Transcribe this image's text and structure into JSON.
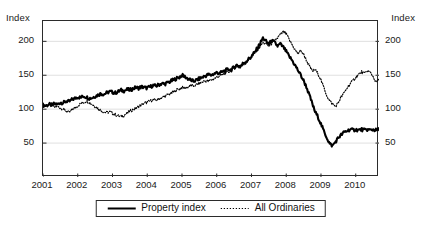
{
  "axes": {
    "left_unit_label": "Index",
    "right_unit_label": "Index",
    "y_ticks": [
      "200",
      "150",
      "100",
      "50"
    ],
    "x_ticks": [
      "2001",
      "2002",
      "2003",
      "2004",
      "2005",
      "2006",
      "2007",
      "2008",
      "2009",
      "2010"
    ]
  },
  "legend": {
    "items": [
      {
        "label": "Property index",
        "style": "solid",
        "color": "#000000"
      },
      {
        "label": "All Ordinaries",
        "style": "dotted",
        "color": "#000000"
      }
    ]
  },
  "chart_data": {
    "type": "line",
    "title": "",
    "subtitle": "",
    "xlabel": "",
    "ylabel": "Index",
    "y_unit_label": "Index",
    "xlim": [
      2001.0,
      2010.67
    ],
    "ylim": [
      0,
      230
    ],
    "y_ticks": [
      50,
      100,
      150,
      200
    ],
    "x_ticks": [
      2001,
      2002,
      2003,
      2004,
      2005,
      2006,
      2007,
      2008,
      2009,
      2010
    ],
    "grid": "horizontal",
    "legend_position": "bottom-center",
    "x": [
      2001.0,
      2001.08,
      2001.17,
      2001.25,
      2001.33,
      2001.42,
      2001.5,
      2001.58,
      2001.67,
      2001.75,
      2001.83,
      2001.92,
      2002.0,
      2002.08,
      2002.17,
      2002.25,
      2002.33,
      2002.42,
      2002.5,
      2002.58,
      2002.67,
      2002.75,
      2002.83,
      2002.92,
      2003.0,
      2003.08,
      2003.17,
      2003.25,
      2003.33,
      2003.42,
      2003.5,
      2003.58,
      2003.67,
      2003.75,
      2003.83,
      2003.92,
      2004.0,
      2004.08,
      2004.17,
      2004.25,
      2004.33,
      2004.42,
      2004.5,
      2004.58,
      2004.67,
      2004.75,
      2004.83,
      2004.92,
      2005.0,
      2005.08,
      2005.17,
      2005.25,
      2005.33,
      2005.42,
      2005.5,
      2005.58,
      2005.67,
      2005.75,
      2005.83,
      2005.92,
      2006.0,
      2006.08,
      2006.17,
      2006.25,
      2006.33,
      2006.42,
      2006.5,
      2006.58,
      2006.67,
      2006.75,
      2006.83,
      2006.92,
      2007.0,
      2007.08,
      2007.17,
      2007.25,
      2007.33,
      2007.42,
      2007.5,
      2007.58,
      2007.67,
      2007.75,
      2007.83,
      2007.92,
      2008.0,
      2008.08,
      2008.17,
      2008.25,
      2008.33,
      2008.42,
      2008.5,
      2008.58,
      2008.67,
      2008.75,
      2008.83,
      2008.92,
      2009.0,
      2009.08,
      2009.17,
      2009.25,
      2009.33,
      2009.42,
      2009.5,
      2009.58,
      2009.67,
      2009.75,
      2009.83,
      2009.92,
      2010.0,
      2010.08,
      2010.17,
      2010.25,
      2010.33,
      2010.42,
      2010.5,
      2010.58,
      2010.67
    ],
    "series": [
      {
        "name": "Property index",
        "style": "solid",
        "color": "#000000",
        "values": [
          106,
          105,
          107,
          106,
          108,
          107,
          110,
          109,
          112,
          111,
          114,
          116,
          118,
          117,
          119,
          118,
          116,
          117,
          119,
          121,
          123,
          122,
          124,
          126,
          125,
          124,
          126,
          128,
          127,
          129,
          128,
          130,
          132,
          131,
          133,
          132,
          131,
          133,
          135,
          134,
          136,
          138,
          137,
          139,
          141,
          143,
          145,
          147,
          150,
          148,
          145,
          143,
          141,
          143,
          145,
          147,
          149,
          151,
          150,
          152,
          154,
          153,
          155,
          157,
          159,
          158,
          162,
          165,
          163,
          167,
          170,
          174,
          178,
          183,
          190,
          197,
          205,
          200,
          196,
          201,
          198,
          193,
          196,
          191,
          185,
          178,
          172,
          165,
          158,
          150,
          142,
          133,
          120,
          108,
          96,
          88,
          78,
          68,
          58,
          49,
          46,
          52,
          58,
          62,
          66,
          68,
          70,
          69,
          70,
          69,
          70,
          69,
          70,
          69,
          70,
          69,
          70
        ]
      },
      {
        "name": "All Ordinaries",
        "style": "dotted",
        "color": "#000000",
        "values": [
          105,
          106,
          107,
          105,
          103,
          104,
          102,
          100,
          97,
          95,
          99,
          102,
          105,
          108,
          110,
          112,
          110,
          107,
          104,
          101,
          98,
          96,
          95,
          96,
          94,
          92,
          90,
          89,
          91,
          94,
          97,
          99,
          101,
          104,
          106,
          109,
          110,
          112,
          114,
          113,
          115,
          117,
          119,
          121,
          123,
          125,
          128,
          130,
          132,
          131,
          133,
          135,
          134,
          136,
          138,
          140,
          142,
          141,
          143,
          145,
          147,
          149,
          151,
          153,
          155,
          157,
          160,
          163,
          161,
          165,
          168,
          172,
          176,
          181,
          187,
          193,
          198,
          196,
          193,
          197,
          201,
          205,
          210,
          214,
          211,
          203,
          195,
          188,
          182,
          186,
          181,
          172,
          163,
          156,
          158,
          152,
          143,
          132,
          120,
          112,
          108,
          104,
          110,
          118,
          124,
          131,
          137,
          142,
          147,
          151,
          155,
          152,
          157,
          154,
          148,
          140,
          143
        ]
      }
    ]
  }
}
